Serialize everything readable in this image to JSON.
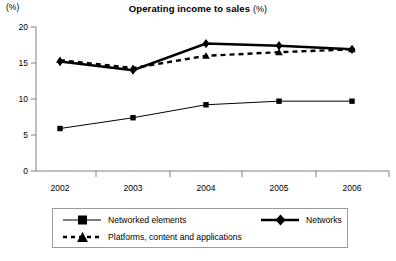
{
  "chart_data": {
    "type": "line",
    "title": "Operating income to sales",
    "title_unit": "(%)",
    "subtitle": "",
    "xlabel": "",
    "ylabel": "(%)",
    "categories": [
      "2002",
      "2003",
      "2004",
      "2005",
      "2006"
    ],
    "x": [
      2002,
      2003,
      2004,
      2005,
      2006
    ],
    "ylim": [
      0,
      20
    ],
    "yticks": [
      0,
      5,
      10,
      15,
      20
    ],
    "ytick_labels": [
      "0",
      "5",
      "10",
      "15",
      "20"
    ],
    "xtick_labels": [
      "2002",
      "2003",
      "2004",
      "2005",
      "2006"
    ],
    "grid": false,
    "legend_position": "bottom",
    "series": [
      {
        "name": "Networked elements",
        "marker": "square",
        "line": "solid-thin",
        "color": "#000000",
        "values": [
          5.9,
          7.4,
          9.2,
          9.7,
          9.7
        ]
      },
      {
        "name": "Networks",
        "marker": "diamond",
        "line": "solid-thick",
        "color": "#000000",
        "values": [
          15.2,
          14.0,
          17.7,
          17.4,
          16.9
        ]
      },
      {
        "name": "Platforms, content and applications",
        "marker": "triangle",
        "line": "dashed-thick",
        "color": "#000000",
        "values": [
          15.4,
          14.3,
          16.0,
          16.5,
          16.9
        ]
      }
    ]
  },
  "legend": {
    "items": [
      {
        "label": "Networked elements"
      },
      {
        "label": "Networks"
      },
      {
        "label": "Platforms, content and applications"
      }
    ]
  },
  "colors": {
    "series": "#000000",
    "axis": "#808080",
    "legend_border": "#9a9a9a",
    "background": "#ffffff"
  }
}
